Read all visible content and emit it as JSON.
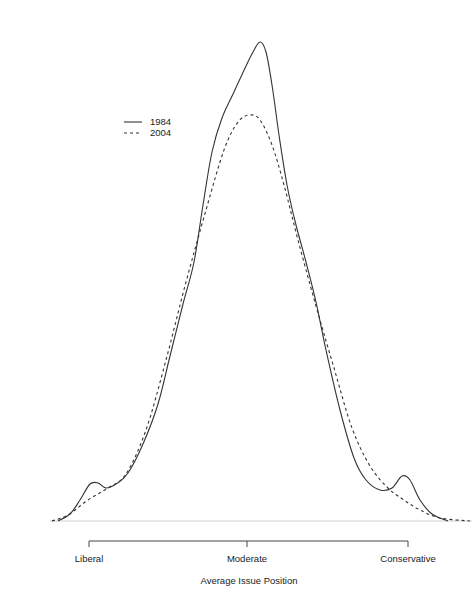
{
  "chart_data": {
    "type": "line",
    "title": "",
    "xlabel": "Average Issue Position",
    "ylabel": "",
    "x_ticks": [
      "Liberal",
      "Moderate",
      "Conservative"
    ],
    "legend": {
      "position": "top-left",
      "entries": [
        {
          "name": "1984",
          "style": "solid"
        },
        {
          "name": "2004",
          "style": "dashed"
        }
      ]
    },
    "grid": false,
    "series": [
      {
        "name": "1984",
        "style": "solid",
        "color": "#333333",
        "points_px": [
          [
            58,
            521
          ],
          [
            70,
            514
          ],
          [
            80,
            500
          ],
          [
            90,
            484
          ],
          [
            98,
            483
          ],
          [
            106,
            488
          ],
          [
            116,
            484
          ],
          [
            128,
            473
          ],
          [
            143,
            444
          ],
          [
            158,
            404
          ],
          [
            170,
            356
          ],
          [
            183,
            304
          ],
          [
            194,
            262
          ],
          [
            203,
            205
          ],
          [
            212,
            152
          ],
          [
            222,
            118
          ],
          [
            234,
            92
          ],
          [
            246,
            66
          ],
          [
            253,
            52
          ],
          [
            260,
            42
          ],
          [
            266,
            52
          ],
          [
            272,
            85
          ],
          [
            279,
            135
          ],
          [
            287,
            185
          ],
          [
            296,
            225
          ],
          [
            306,
            262
          ],
          [
            316,
            302
          ],
          [
            326,
            350
          ],
          [
            340,
            410
          ],
          [
            354,
            458
          ],
          [
            366,
            480
          ],
          [
            380,
            490
          ],
          [
            392,
            488
          ],
          [
            402,
            476
          ],
          [
            410,
            480
          ],
          [
            420,
            500
          ],
          [
            432,
            514
          ],
          [
            448,
            521
          ]
        ]
      },
      {
        "name": "2004",
        "style": "dashed",
        "color": "#333333",
        "points_px": [
          [
            52,
            521
          ],
          [
            68,
            515
          ],
          [
            88,
            500
          ],
          [
            108,
            488
          ],
          [
            126,
            474
          ],
          [
            146,
            430
          ],
          [
            166,
            360
          ],
          [
            186,
            282
          ],
          [
            206,
            210
          ],
          [
            224,
            150
          ],
          [
            238,
            122
          ],
          [
            250,
            115
          ],
          [
            260,
            120
          ],
          [
            272,
            145
          ],
          [
            284,
            185
          ],
          [
            298,
            240
          ],
          [
            316,
            306
          ],
          [
            334,
            368
          ],
          [
            352,
            428
          ],
          [
            370,
            466
          ],
          [
            388,
            488
          ],
          [
            404,
            500
          ],
          [
            420,
            510
          ],
          [
            440,
            518
          ],
          [
            470,
            521
          ]
        ]
      }
    ],
    "annotations": {
      "baseline_y_px": 521,
      "axis_bracket": {
        "y_px": 541,
        "ticks_x_px": [
          89,
          247,
          408
        ]
      }
    }
  },
  "axis": {
    "ticks": [
      "Liberal",
      "Moderate",
      "Conservative"
    ],
    "title": "Average Issue Position"
  },
  "legend": {
    "entries": [
      "1984",
      "2004"
    ]
  }
}
